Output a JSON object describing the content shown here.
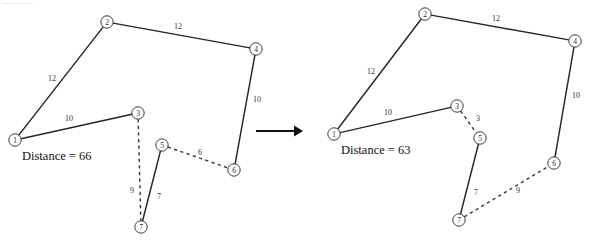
{
  "figure": {
    "type": "graph-diagram",
    "background": "#ffffff",
    "width": 591,
    "height": 242,
    "node_fill": "#ffffff",
    "node_stroke": "#3a3a3a",
    "solid_edge_color": "#262626",
    "dashed_edge_color": "#3a3a3a",
    "arrow_color": "#111111",
    "node_radius": 6.2,
    "top_artifact_text": "—  ——  —"
  },
  "arrow": {
    "name": "transform-arrow",
    "x1": 256,
    "y1": 131,
    "x2": 303,
    "y2": 131,
    "head_size": 9
  },
  "panels": [
    {
      "id": "before",
      "name": "left-graph-panel",
      "distance_label": "Distance = 66",
      "distance_x": 22,
      "distance_y": 156,
      "nodes": [
        {
          "id": "1",
          "x": 15,
          "y": 140
        },
        {
          "id": "2",
          "x": 107,
          "y": 22
        },
        {
          "id": "3",
          "x": 138,
          "y": 113
        },
        {
          "id": "4",
          "x": 256,
          "y": 49
        },
        {
          "id": "5",
          "x": 162,
          "y": 145
        },
        {
          "id": "6",
          "x": 234,
          "y": 170
        },
        {
          "id": "7",
          "x": 141,
          "y": 227
        }
      ],
      "edges": [
        {
          "from": "1",
          "to": "2",
          "style": "solid",
          "weight": "12",
          "lx": 52,
          "ly": 78
        },
        {
          "from": "2",
          "to": "4",
          "style": "solid",
          "weight": "12",
          "lx": 178,
          "ly": 26
        },
        {
          "from": "4",
          "to": "6",
          "style": "solid",
          "weight": "10",
          "lx": 257,
          "ly": 99
        },
        {
          "from": "1",
          "to": "3",
          "style": "solid",
          "weight": "10",
          "lx": 69,
          "ly": 118
        },
        {
          "from": "5",
          "to": "7",
          "style": "solid",
          "weight": "7",
          "lx": 159,
          "ly": 196
        },
        {
          "from": "3",
          "to": "7",
          "style": "dashed",
          "weight": "9",
          "lx": 132,
          "ly": 190
        },
        {
          "from": "5",
          "to": "6",
          "style": "dashed",
          "weight": "6",
          "lx": 200,
          "ly": 152
        }
      ]
    },
    {
      "id": "after",
      "name": "right-graph-panel",
      "distance_label": "Distance = 63",
      "distance_x": 341,
      "distance_y": 150,
      "nodes": [
        {
          "id": "1",
          "x": 334,
          "y": 134
        },
        {
          "id": "2",
          "x": 425,
          "y": 14
        },
        {
          "id": "3",
          "x": 457,
          "y": 106
        },
        {
          "id": "4",
          "x": 575,
          "y": 41
        },
        {
          "id": "5",
          "x": 480,
          "y": 138
        },
        {
          "id": "6",
          "x": 554,
          "y": 163
        },
        {
          "id": "7",
          "x": 459,
          "y": 220
        }
      ],
      "edges": [
        {
          "from": "1",
          "to": "2",
          "style": "solid",
          "weight": "12",
          "lx": 371,
          "ly": 71
        },
        {
          "from": "2",
          "to": "4",
          "style": "solid",
          "weight": "12",
          "lx": 496,
          "ly": 18
        },
        {
          "from": "4",
          "to": "6",
          "style": "solid",
          "weight": "10",
          "lx": 576,
          "ly": 95
        },
        {
          "from": "1",
          "to": "3",
          "style": "solid",
          "weight": "10",
          "lx": 388,
          "ly": 112
        },
        {
          "from": "5",
          "to": "7",
          "style": "solid",
          "weight": "7",
          "lx": 476,
          "ly": 192
        },
        {
          "from": "3",
          "to": "5",
          "style": "dashed",
          "weight": "3",
          "lx": 478,
          "ly": 118
        },
        {
          "from": "7",
          "to": "6",
          "style": "dashed",
          "weight": "9",
          "lx": 518,
          "ly": 190
        }
      ]
    }
  ]
}
